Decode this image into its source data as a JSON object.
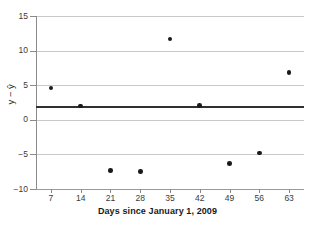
{
  "chart_data": {
    "type": "scatter",
    "title": "",
    "xlabel": "Days since January 1, 2009",
    "ylabel": "y − ŷ",
    "x": [
      7,
      14,
      21,
      28,
      35,
      42,
      49,
      56,
      63
    ],
    "values": [
      4.6,
      2.0,
      -7.3,
      -7.5,
      11.7,
      2.1,
      -6.3,
      -4.8,
      6.8
    ],
    "series": [
      {
        "name": "residuals",
        "points": [
          {
            "x": 7,
            "y": 4.6
          },
          {
            "x": 14,
            "y": 2.0
          },
          {
            "x": 21,
            "y": -7.3
          },
          {
            "x": 28,
            "y": -7.5
          },
          {
            "x": 35,
            "y": 11.7
          },
          {
            "x": 42,
            "y": 2.1
          },
          {
            "x": 49,
            "y": -6.3
          },
          {
            "x": 56,
            "y": -4.8
          },
          {
            "x": 63,
            "y": 6.8
          }
        ],
        "marker_color": "#1a1a1a"
      }
    ],
    "reference_line": {
      "name": "mean-residual-line",
      "orientation": "horizontal",
      "y": 1.9,
      "color": "#303030"
    },
    "xlim": [
      3.5,
      66.5
    ],
    "ylim": [
      -10,
      15
    ],
    "xticks": [
      7,
      14,
      21,
      28,
      35,
      42,
      49,
      56,
      63
    ],
    "xtick_labels": [
      "7",
      "14",
      "21",
      "28",
      "35",
      "42",
      "49",
      "56",
      "63"
    ],
    "yticks": [
      -10,
      -5,
      0,
      5,
      10,
      15
    ],
    "ytick_labels": [
      "−10",
      "−5",
      "0",
      "5",
      "10",
      "15"
    ],
    "grid": "horizontal",
    "legend": "none",
    "background_color": "#ffffff",
    "gridline_color": "#c9c9c9"
  }
}
